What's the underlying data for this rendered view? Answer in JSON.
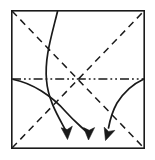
{
  "diagram": {
    "title": "Origami fold step diagram",
    "type": "origami-instruction",
    "background_color": "#ffffff",
    "ink_color": "#1a1a1a",
    "canvas": {
      "width": 155,
      "height": 160
    },
    "paper": {
      "label": "paper-square",
      "x": 11,
      "y": 10,
      "width": 134,
      "height": 139,
      "stroke_color": "#1a1a1a",
      "fill_color": "#ffffff"
    },
    "creases": [
      {
        "name": "diagonal-crease-top-left-to-bottom-right",
        "style": "valley-dashed",
        "from": {
          "x": 11,
          "y": 10
        },
        "to": {
          "x": 145,
          "y": 149
        },
        "dash_pattern": "7 5"
      },
      {
        "name": "diagonal-crease-bottom-left-to-top-right",
        "style": "valley-dashed",
        "from": {
          "x": 11,
          "y": 149
        },
        "to": {
          "x": 145,
          "y": 10
        },
        "dash_pattern": "7 5"
      },
      {
        "name": "horizontal-crease-midline",
        "style": "mountain-dash-dot-dot",
        "from": {
          "x": 11,
          "y": 79
        },
        "to": {
          "x": 145,
          "y": 79
        },
        "dash_pattern": "9 3 1.6 3 1.6 3"
      }
    ],
    "center_point": {
      "x": 78,
      "y": 79
    },
    "arrows": [
      {
        "name": "fold-arrow-left-curve",
        "style": "solid-curve-with-arrowhead",
        "start": {
          "x": 57,
          "y": 11
        },
        "end": {
          "x": 68,
          "y": 136
        },
        "direction": "down",
        "meaning": "fold down"
      },
      {
        "name": "fold-arrow-middle-curve",
        "style": "solid-curve-with-arrowhead",
        "start": {
          "x": 13,
          "y": 79
        },
        "end": {
          "x": 90,
          "y": 136
        },
        "direction": "down",
        "meaning": "fold down"
      },
      {
        "name": "fold-arrow-right-curve",
        "style": "solid-curve-with-arrowhead",
        "start": {
          "x": 143,
          "y": 79
        },
        "end": {
          "x": 110,
          "y": 138
        },
        "direction": "down-left",
        "meaning": "fold down"
      }
    ]
  }
}
